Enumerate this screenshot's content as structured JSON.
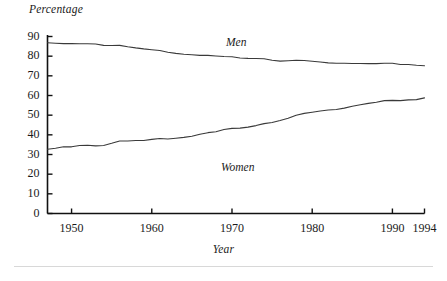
{
  "figure": {
    "ylabel": "Percentage",
    "xlabel": "Year",
    "bottom_rule": "horizontal-rule",
    "line_color": "#3a3a3a",
    "axis_color": "#111111",
    "background": "#ffffff"
  },
  "labels": {
    "men": "Men",
    "women": "Women"
  },
  "axes": {
    "y_ticks": [
      "0",
      "10",
      "20",
      "30",
      "40",
      "50",
      "60",
      "70",
      "80",
      "90"
    ],
    "x_ticks": [
      "1950",
      "1960",
      "1970",
      "1980",
      "1990",
      "1994"
    ]
  },
  "chart_data": {
    "type": "line",
    "title": "",
    "xlabel": "Year",
    "ylabel": "Percentage",
    "xlim": [
      1947,
      1994
    ],
    "ylim": [
      0,
      90
    ],
    "grid": false,
    "legend": "inline-annotations",
    "x": [
      1947,
      1948,
      1949,
      1950,
      1951,
      1952,
      1953,
      1954,
      1955,
      1956,
      1957,
      1958,
      1959,
      1960,
      1961,
      1962,
      1963,
      1964,
      1965,
      1966,
      1967,
      1968,
      1969,
      1970,
      1971,
      1972,
      1973,
      1974,
      1975,
      1976,
      1977,
      1978,
      1979,
      1980,
      1981,
      1982,
      1983,
      1984,
      1985,
      1986,
      1987,
      1988,
      1989,
      1990,
      1991,
      1992,
      1993,
      1994
    ],
    "series": [
      {
        "name": "Men",
        "values": [
          86.8,
          86.6,
          86.4,
          86.4,
          86.3,
          86.3,
          86.2,
          85.5,
          85.4,
          85.5,
          84.8,
          84.2,
          83.7,
          83.3,
          82.9,
          82.0,
          81.4,
          81.0,
          80.7,
          80.4,
          80.4,
          80.1,
          79.8,
          79.7,
          79.1,
          78.9,
          78.8,
          78.7,
          77.9,
          77.5,
          77.7,
          77.9,
          77.8,
          77.4,
          77.0,
          76.6,
          76.4,
          76.4,
          76.3,
          76.3,
          76.2,
          76.2,
          76.4,
          76.4,
          75.8,
          75.8,
          75.4,
          75.1
        ]
      },
      {
        "name": "Women",
        "values": [
          32.7,
          33.2,
          33.9,
          33.9,
          34.6,
          34.7,
          34.4,
          34.6,
          35.7,
          36.9,
          36.9,
          37.1,
          37.1,
          37.7,
          38.1,
          37.9,
          38.3,
          38.7,
          39.3,
          40.3,
          41.1,
          41.6,
          42.7,
          43.3,
          43.4,
          43.9,
          44.7,
          45.7,
          46.3,
          47.3,
          48.4,
          50.0,
          50.9,
          51.5,
          52.1,
          52.6,
          52.9,
          53.6,
          54.5,
          55.3,
          56.0,
          56.6,
          57.4,
          57.5,
          57.4,
          57.8,
          57.9,
          58.8
        ]
      }
    ]
  }
}
